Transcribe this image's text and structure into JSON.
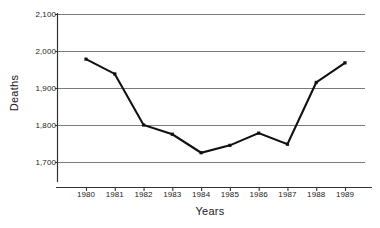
{
  "chart_data": {
    "type": "line",
    "title": "",
    "xlabel": "Years",
    "ylabel": "Deaths",
    "categories": [
      "1980",
      "1981",
      "1982",
      "1983",
      "1984",
      "1985",
      "1986",
      "1987",
      "1988",
      "1989"
    ],
    "values": [
      1978,
      1938,
      1800,
      1775,
      1725,
      1745,
      1778,
      1748,
      1915,
      1968
    ],
    "series": [
      {
        "name": "Deaths",
        "values": [
          1978,
          1938,
          1800,
          1775,
          1725,
          1745,
          1778,
          1748,
          1915,
          1968
        ]
      }
    ],
    "ylim": [
      1650,
      2100
    ],
    "yticks": [
      2100,
      2000,
      1900,
      1800,
      1700
    ],
    "ytick_labels": [
      "2,100",
      "2,000",
      "1,900",
      "1,800",
      "1,700"
    ],
    "xtick_labels": [
      "1980",
      "1981",
      "1982",
      "1983",
      "1984",
      "1985",
      "1986",
      "1987",
      "1988",
      "1989"
    ],
    "grid": true,
    "grid_axis": "y",
    "legend": false,
    "legend_position": "none",
    "marker": "square",
    "line_color": "#111111",
    "grid_color": "#7a7a7a",
    "axis_color": "#333333",
    "background_color": "#ffffff"
  },
  "axes": {
    "y_title": "Deaths",
    "x_title": "Years"
  }
}
